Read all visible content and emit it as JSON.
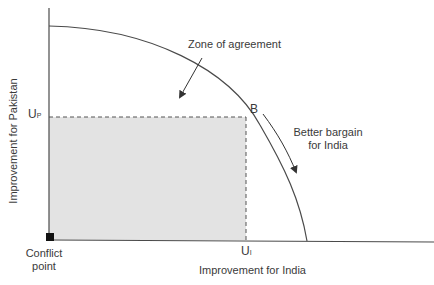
{
  "diagram": {
    "y_axis_label": "Improvement for Pakistan",
    "x_axis_label": "Improvement for India",
    "up_label_main": "U",
    "up_label_sub": "P",
    "ui_label_main": "U",
    "ui_label_sub": "I",
    "point_b_label": "B",
    "zone_label": "Zone of agreement",
    "better_bargain_line1": "Better bargain",
    "better_bargain_line2": "for India",
    "conflict_line1": "Conflict",
    "conflict_line2": "point",
    "colors": {
      "axis": "#4a4a4a",
      "curve": "#4a4a4a",
      "shaded_region": "#e3e3e3",
      "conflict_marker": "#111111",
      "text": "#3a3a3a"
    }
  }
}
